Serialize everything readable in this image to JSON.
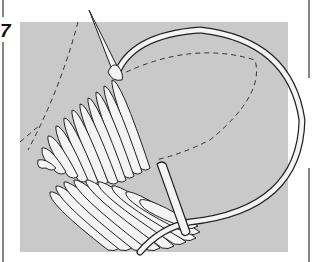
{
  "figure": {
    "step_number": "7",
    "colors": {
      "background": "#ffffff",
      "fabric": "#c9c9c9",
      "outline": "#222222",
      "thread": "#f4f4f4",
      "border": "#333333"
    }
  }
}
